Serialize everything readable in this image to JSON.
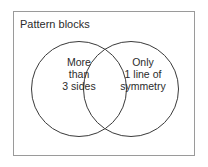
{
  "figure": {
    "title": "Pattern blocks",
    "type": "venn-diagram",
    "frame": {
      "stroke_color": "#9a9a9a"
    },
    "circle_stroke_color": "#3a3a3a",
    "text_color": "#2b2b2b",
    "background_color": "#ffffff"
  },
  "sets": {
    "left": {
      "name": "more-than-3-sides",
      "lines": [
        "More",
        "than",
        "3 sides"
      ],
      "line1": "More",
      "line2": "than",
      "line3": "3 sides"
    },
    "right": {
      "name": "only-1-line-of-symmetry",
      "lines": [
        "Only",
        "1 line of",
        "symmetry"
      ],
      "line1": "Only",
      "line2": "1 line of",
      "line3": "symmetry"
    }
  }
}
